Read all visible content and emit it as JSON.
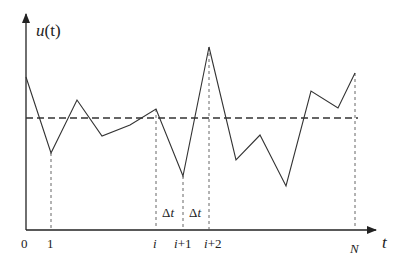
{
  "diagram": {
    "y_axis_label_italic": "u",
    "y_axis_label_paren": "(t)",
    "x_axis_label": "t",
    "origin_label": "0",
    "tick_labels": {
      "one": "1",
      "i": "i",
      "i_plus_1_var": "i",
      "i_plus_1_rest": "+1",
      "i_plus_2_var": "i",
      "i_plus_2_rest": "+2",
      "N": "N"
    },
    "interval_labels": {
      "delta": "Δ",
      "t": "t"
    },
    "mean_level_y": 118,
    "signal_points": [
      [
        26,
        77
      ],
      [
        51,
        153
      ],
      [
        77,
        100
      ],
      [
        102,
        136
      ],
      [
        130,
        125
      ],
      [
        156,
        109
      ],
      [
        183,
        176
      ],
      [
        209,
        47
      ],
      [
        236,
        160
      ],
      [
        260,
        135
      ],
      [
        286,
        186
      ],
      [
        311,
        91
      ],
      [
        338,
        108
      ],
      [
        355,
        73
      ]
    ],
    "colors": {
      "line": "#333333",
      "axis": "#222222"
    }
  }
}
